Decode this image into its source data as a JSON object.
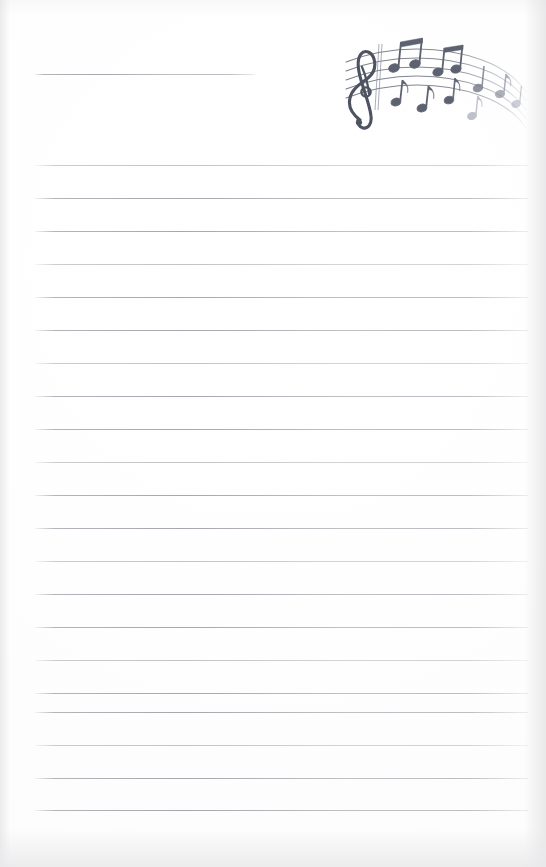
{
  "page": {
    "kind": "scanned-lined-notepaper",
    "width": 546,
    "height": 867,
    "background_color": "#ffffff",
    "rule_color": "#9ca0a8",
    "artwork_color": "#5d6270"
  },
  "artwork": {
    "name": "music-staff-illustration",
    "description": "Hand-drawn curved five-line musical staff with treble clef and beamed eighth notes",
    "icon": "music-staff-icon",
    "clef": "treble-clef",
    "position": {
      "x": 332,
      "y": 28,
      "width": 196,
      "height": 102
    },
    "color": "#5d6270",
    "staff_line_count": 5,
    "barline_count": 1,
    "notes": [
      {
        "type": "eighth-note",
        "beam_group": 1
      },
      {
        "type": "eighth-note",
        "beam_group": 1
      },
      {
        "type": "eighth-note",
        "beam_group": 2
      },
      {
        "type": "eighth-note",
        "beam_group": 2
      },
      {
        "type": "eighth-note",
        "beam_group": 3
      },
      {
        "type": "eighth-note",
        "beam_group": 3
      },
      {
        "type": "eighth-note",
        "beam_group": 4
      },
      {
        "type": "eighth-note",
        "beam_group": 4
      },
      {
        "type": "eighth-note",
        "beam_group": 5
      },
      {
        "type": "eighth-note",
        "beam_group": 5
      }
    ]
  },
  "rules": {
    "left_margin": 35,
    "right_margin": 528,
    "spacing": 33,
    "lines": [
      {
        "index": 0,
        "y": 74,
        "x_start": 35,
        "x_end": 255,
        "short": true
      },
      {
        "index": 1,
        "y": 165,
        "x_start": 35,
        "x_end": 528,
        "short": false
      },
      {
        "index": 2,
        "y": 198,
        "x_start": 35,
        "x_end": 528,
        "short": false
      },
      {
        "index": 3,
        "y": 231,
        "x_start": 35,
        "x_end": 528,
        "short": false
      },
      {
        "index": 4,
        "y": 264,
        "x_start": 35,
        "x_end": 528,
        "short": false
      },
      {
        "index": 5,
        "y": 297,
        "x_start": 35,
        "x_end": 528,
        "short": false
      },
      {
        "index": 6,
        "y": 330,
        "x_start": 35,
        "x_end": 528,
        "short": false
      },
      {
        "index": 7,
        "y": 363,
        "x_start": 35,
        "x_end": 528,
        "short": false
      },
      {
        "index": 8,
        "y": 396,
        "x_start": 35,
        "x_end": 528,
        "short": false
      },
      {
        "index": 9,
        "y": 429,
        "x_start": 35,
        "x_end": 528,
        "short": false
      },
      {
        "index": 10,
        "y": 462,
        "x_start": 35,
        "x_end": 528,
        "short": false
      },
      {
        "index": 11,
        "y": 495,
        "x_start": 35,
        "x_end": 528,
        "short": false
      },
      {
        "index": 12,
        "y": 528,
        "x_start": 35,
        "x_end": 528,
        "short": false
      },
      {
        "index": 13,
        "y": 561,
        "x_start": 35,
        "x_end": 528,
        "short": false
      },
      {
        "index": 14,
        "y": 594,
        "x_start": 35,
        "x_end": 528,
        "short": false
      },
      {
        "index": 15,
        "y": 627,
        "x_start": 35,
        "x_end": 528,
        "short": false
      },
      {
        "index": 16,
        "y": 660,
        "x_start": 35,
        "x_end": 528,
        "short": false
      },
      {
        "index": 17,
        "y": 693,
        "x_start": 35,
        "x_end": 528,
        "short": false
      },
      {
        "index": 18,
        "y": 712,
        "x_start": 35,
        "x_end": 528,
        "short": false
      },
      {
        "index": 19,
        "y": 745,
        "x_start": 35,
        "x_end": 528,
        "short": false
      },
      {
        "index": 20,
        "y": 778,
        "x_start": 35,
        "x_end": 528,
        "short": false
      },
      {
        "index": 21,
        "y": 810,
        "x_start": 35,
        "x_end": 528,
        "short": false
      }
    ]
  },
  "text_content": {
    "visible_text": "",
    "note": "No written text is present on the page"
  }
}
